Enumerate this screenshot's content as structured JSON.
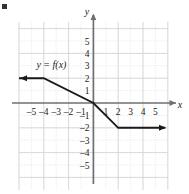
{
  "figure": {
    "bullet_mark": "▪",
    "curve_label": "y = f(x)",
    "axis_x_label": "x",
    "axis_y_label": "y",
    "colors": {
      "grid": "#d9d9d9",
      "axis": "#6b6b6b",
      "curve": "#1a1a1a",
      "text": "#1a1a1a",
      "background": "#ffffff"
    }
  },
  "chart_data": {
    "type": "line",
    "title": "",
    "xlabel": "x",
    "ylabel": "y",
    "xlim": [
      -6.5,
      6.5
    ],
    "ylim": [
      -6.5,
      6.5
    ],
    "grid": true,
    "grid_spacing": 1,
    "legend": "none",
    "annotations": [
      {
        "text": "y = f(x)",
        "x": -4.6,
        "y": 2.85
      }
    ],
    "xticks": [
      -5,
      -4,
      -3,
      -2,
      -1,
      1,
      2,
      3,
      4,
      5
    ],
    "xtick_labels": [
      "–5",
      "–4",
      "–3",
      "–2",
      "–1",
      "1",
      "2",
      "3",
      "4",
      "5"
    ],
    "yticks": [
      5,
      4,
      3,
      2,
      1,
      -1,
      -2,
      -3,
      -4,
      -5
    ],
    "ytick_labels": [
      "5",
      "4",
      "3",
      "2",
      "1",
      "–1",
      "–2",
      "–3",
      "–4",
      "–5"
    ],
    "series": [
      {
        "name": "f(x)",
        "kind": "piecewise-linear",
        "points": [
          {
            "x": -6.0,
            "y": 2
          },
          {
            "x": -4,
            "y": 2
          },
          {
            "x": 0,
            "y": 0
          },
          {
            "x": 2,
            "y": -2
          },
          {
            "x": 5.8,
            "y": -2
          }
        ],
        "arrow_start": true,
        "arrow_end": true
      }
    ]
  }
}
